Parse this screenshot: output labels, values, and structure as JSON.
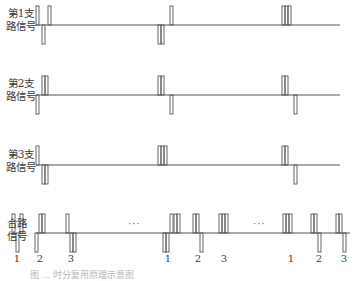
{
  "rows": [
    {
      "label_line1": "第1支",
      "label_line2": "路信号",
      "pulses": [
        {
          "slot": 0,
          "pos": 0,
          "pol": "up",
          "bars": 1
        },
        {
          "slot": 0,
          "pos": 1,
          "pol": "down",
          "bars": 1
        },
        {
          "slot": 0,
          "pos": 2,
          "pol": "up",
          "bars": 1
        },
        {
          "slot": 1,
          "pos": 0,
          "pol": "down",
          "bars": 2
        },
        {
          "slot": 1,
          "pos": 2,
          "pol": "up",
          "bars": 1
        },
        {
          "slot": 2,
          "pos": 0,
          "pol": "up",
          "bars": 3
        }
      ]
    },
    {
      "label_line1": "第2支",
      "label_line2": "路信号",
      "pulses": [
        {
          "slot": 0,
          "pos": 0,
          "pol": "down",
          "bars": 1
        },
        {
          "slot": 0,
          "pos": 1,
          "pol": "up",
          "bars": 2
        },
        {
          "slot": 1,
          "pos": 0,
          "pol": "up",
          "bars": 2
        },
        {
          "slot": 1,
          "pos": 2,
          "pol": "down",
          "bars": 1
        },
        {
          "slot": 2,
          "pos": 0,
          "pol": "up",
          "bars": 2
        },
        {
          "slot": 2,
          "pos": 2,
          "pol": "down",
          "bars": 1
        }
      ]
    },
    {
      "label_line1": "第3支",
      "label_line2": "路信号",
      "pulses": [
        {
          "slot": 0,
          "pos": 0,
          "pol": "up",
          "bars": 1
        },
        {
          "slot": 0,
          "pos": 1,
          "pol": "down",
          "bars": 2
        },
        {
          "slot": 1,
          "pos": 0,
          "pol": "up",
          "bars": 3
        },
        {
          "slot": 2,
          "pos": 0,
          "pol": "up",
          "bars": 2
        },
        {
          "slot": 2,
          "pos": 2,
          "pol": "down",
          "bars": 1
        }
      ]
    }
  ],
  "combined": {
    "label_line1": "合路",
    "label_line2": "信号",
    "ellipsis": "···",
    "slot_numbers": [
      "1",
      "2",
      "3",
      "1",
      "2",
      "3",
      "1",
      "2",
      "3"
    ]
  },
  "caption": "图 ... 时分复用原理示意图"
}
